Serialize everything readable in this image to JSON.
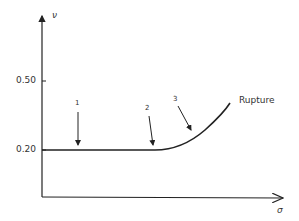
{
  "diagram": {
    "y_axis_label": "ν",
    "x_axis_label": "σ",
    "y_ticks": [
      {
        "label": "0.50",
        "y": 81
      },
      {
        "label": "0.20",
        "y": 150
      }
    ],
    "markers": [
      {
        "label": "1"
      },
      {
        "label": "2"
      },
      {
        "label": "3"
      }
    ],
    "curve_end_label": "Rupture",
    "stroke_color": "#222222"
  }
}
